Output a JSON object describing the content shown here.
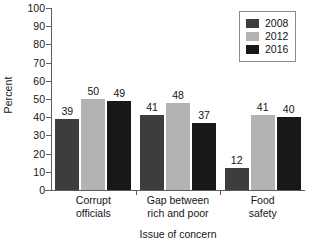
{
  "chart_data": {
    "type": "bar",
    "title": "",
    "subtitle": "",
    "xlabel": "Issue of concern",
    "ylabel": "Percent",
    "ylim": [
      0,
      100
    ],
    "yticks": [
      0,
      10,
      20,
      30,
      40,
      50,
      60,
      70,
      80,
      90,
      100
    ],
    "ytick_labels": [
      "0",
      "10",
      "20",
      "30",
      "40",
      "50",
      "60",
      "70",
      "80",
      "90",
      "100"
    ],
    "grid": false,
    "legend_position": "top-right",
    "categories": [
      "Corrupt officials",
      "Gap between rich and poor",
      "Food safety"
    ],
    "category_lines": [
      [
        "Corrupt",
        "officials"
      ],
      [
        "Gap between",
        "rich and poor"
      ],
      [
        "Food",
        "safety"
      ]
    ],
    "series": [
      {
        "name": "2008",
        "color": "#3d3d3d",
        "values": [
          39,
          41,
          12
        ],
        "labels": [
          "39",
          "41",
          "12"
        ]
      },
      {
        "name": "2012",
        "color": "#b3b3b3",
        "values": [
          50,
          48,
          41
        ],
        "labels": [
          "50",
          "48",
          "41"
        ]
      },
      {
        "name": "2016",
        "color": "#181818",
        "values": [
          49,
          37,
          40
        ],
        "labels": [
          "49",
          "37",
          "40"
        ]
      }
    ],
    "annotations": []
  },
  "legend": {
    "entries": [
      {
        "label": "2008",
        "color": "#3d3d3d"
      },
      {
        "label": "2012",
        "color": "#b3b3b3"
      },
      {
        "label": "2016",
        "color": "#181818"
      }
    ]
  },
  "axes": {
    "axis_color": "#5d5d5d",
    "text_color": "#161616"
  }
}
